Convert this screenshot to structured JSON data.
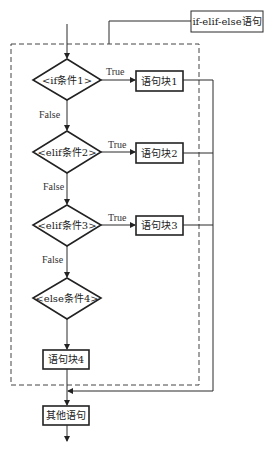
{
  "title_label": "if-elif-else语句",
  "decisions": [
    {
      "label": "<if条件1>",
      "true_label": "True",
      "false_label": "False",
      "block": "语句块1"
    },
    {
      "label": "<elif条件2>",
      "true_label": "True",
      "false_label": "False",
      "block": "语句块2"
    },
    {
      "label": "<elif条件3>",
      "true_label": "True",
      "false_label": "False",
      "block": "语句块3"
    },
    {
      "label": "<else条件4>"
    }
  ],
  "else_block": "语句块4",
  "next_block": "其他语句"
}
